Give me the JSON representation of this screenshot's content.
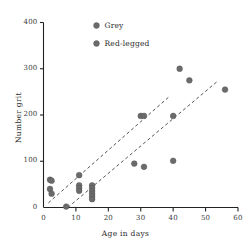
{
  "chart_data": {
    "type": "scatter",
    "title": "",
    "xlabel": "Age in days",
    "ylabel": "Number grit",
    "xlim": [
      0,
      60
    ],
    "ylim": [
      0,
      400
    ],
    "xticks": [
      0,
      10,
      20,
      30,
      40,
      50,
      60
    ],
    "yticks": [
      0,
      100,
      200,
      300,
      400
    ],
    "xtick_labels": [
      "0",
      "10",
      "20",
      "30",
      "40",
      "50",
      "60"
    ],
    "ytick_labels": [
      "0",
      "100",
      "200",
      "300",
      "400"
    ],
    "grid": false,
    "legend_position": "top-center",
    "marker_color": "#6b6b6b",
    "axis_color": "#222222",
    "trendline_color": "#555555",
    "series": [
      {
        "name": "Grey",
        "color": "#6b6b6b",
        "points": [
          {
            "x": 2,
            "y": 60
          },
          {
            "x": 2.5,
            "y": 58
          },
          {
            "x": 2,
            "y": 40
          },
          {
            "x": 2.5,
            "y": 30
          },
          {
            "x": 11,
            "y": 70
          },
          {
            "x": 11,
            "y": 48
          },
          {
            "x": 11,
            "y": 42
          },
          {
            "x": 11,
            "y": 36
          },
          {
            "x": 7,
            "y": 2
          },
          {
            "x": 30,
            "y": 198
          },
          {
            "x": 31,
            "y": 198
          },
          {
            "x": 42,
            "y": 300
          },
          {
            "x": 45,
            "y": 275
          },
          {
            "x": 56,
            "y": 255
          }
        ]
      },
      {
        "name": "Red-legged",
        "color": "#6b6b6b",
        "points": [
          {
            "x": 15,
            "y": 48
          },
          {
            "x": 15,
            "y": 42
          },
          {
            "x": 15,
            "y": 36
          },
          {
            "x": 15,
            "y": 30
          },
          {
            "x": 15,
            "y": 24
          },
          {
            "x": 15,
            "y": 18
          },
          {
            "x": 28,
            "y": 95
          },
          {
            "x": 31,
            "y": 88
          },
          {
            "x": 40,
            "y": 101
          },
          {
            "x": 40,
            "y": 198
          }
        ]
      }
    ],
    "trendlines": [
      {
        "name": "grey-trendline",
        "style": "dashed",
        "x1": 1.5,
        "y1": 10,
        "x2": 38.5,
        "y2": 238
      },
      {
        "name": "red-legged-trendline",
        "style": "dashed",
        "x1": 7.5,
        "y1": 0,
        "x2": 53.5,
        "y2": 272
      }
    ],
    "legend": [
      {
        "label": "Grey",
        "marker": "filled-circle",
        "color": "#6b6b6b"
      },
      {
        "label": "Red-legged",
        "marker": "filled-circle",
        "color": "#6b6b6b"
      }
    ]
  }
}
